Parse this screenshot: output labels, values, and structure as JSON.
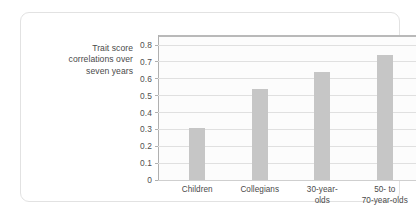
{
  "card": {
    "title_lines": [
      "Trait score",
      "correlations over",
      "seven years"
    ]
  },
  "colors": {
    "bar": "#c6c6c6",
    "gridline": "#e0e0e0",
    "axis": "#b0b0b0",
    "top_rule": "#b9b9b9",
    "text": "#4a4a4a",
    "card_border": "#e2e2e2"
  },
  "chart_data": {
    "type": "bar",
    "title": "Trait score correlations over seven years",
    "xlabel": "",
    "ylabel": "",
    "categories": [
      "Children",
      "Collegians",
      "30-year-olds",
      "50- to 70-year-olds"
    ],
    "category_label_lines": [
      [
        "Children"
      ],
      [
        "Collegians"
      ],
      [
        "30-year-",
        "olds"
      ],
      [
        "50-  to",
        "70-year-olds"
      ]
    ],
    "values": [
      0.31,
      0.54,
      0.64,
      0.74
    ],
    "ylim": [
      0,
      0.86
    ],
    "yticks": [
      0,
      0.1,
      0.2,
      0.3,
      0.4,
      0.5,
      0.6,
      0.7,
      0.8
    ],
    "ytick_labels": [
      "0",
      "0.1",
      "0.2",
      "0.3",
      "0.4",
      "0.5",
      "0.6",
      "0.7",
      "0.8"
    ],
    "grid": true,
    "legend": false
  }
}
